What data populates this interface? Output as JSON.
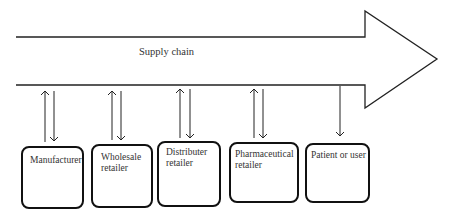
{
  "diagram": {
    "title": "Supply chain",
    "colors": {
      "stroke": "#111111",
      "background": "#ffffff",
      "text": "#333333"
    },
    "arrow": {
      "direction": "right",
      "label": "Supply chain"
    },
    "nodes": [
      {
        "id": "manufacturer",
        "label": "Manufacturer",
        "flow": "bidirectional"
      },
      {
        "id": "wholesale",
        "label": "Wholesale\nretailer",
        "flow": "bidirectional"
      },
      {
        "id": "distributer",
        "label": "Distributer\nretailer",
        "flow": "bidirectional"
      },
      {
        "id": "pharma",
        "label": "Pharmaceutical\nretailer",
        "flow": "bidirectional"
      },
      {
        "id": "patient",
        "label": "Patient or user",
        "flow": "down-only"
      }
    ]
  }
}
